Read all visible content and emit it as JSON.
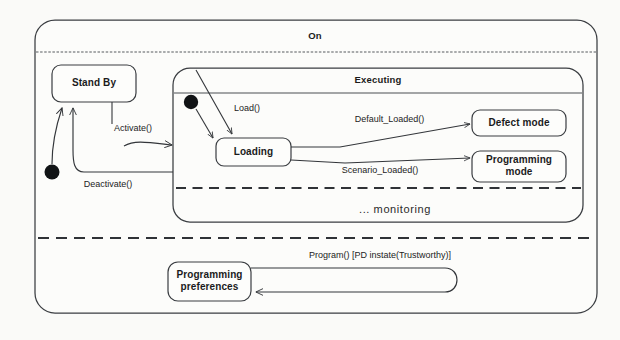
{
  "diagram": {
    "kind": "uml-state-machine-diagram",
    "background_color": "#fafaf8",
    "line_color": "#33363a",
    "text_color": "#1b1b1b"
  },
  "outer_state": {
    "name": "On",
    "label": "On"
  },
  "states": {
    "stand_by": {
      "label": "Stand By"
    },
    "executing": {
      "label": "Executing"
    },
    "loading": {
      "label": "Loading"
    },
    "defect_mode": {
      "label": "Defect mode"
    },
    "programming_mode_line1": {
      "label": "Programming"
    },
    "programming_mode_line2": {
      "label": "mode"
    },
    "programming_preferences_line1": {
      "label": "Programming"
    },
    "programming_preferences_line2": {
      "label": "preferences"
    }
  },
  "regions": {
    "monitoring": {
      "label": "... monitoring"
    }
  },
  "transitions": {
    "activate": {
      "label": "Activate()"
    },
    "deactivate": {
      "label": "Deactivate()"
    },
    "load": {
      "label": "Load()"
    },
    "default_loaded": {
      "label": "Default_Loaded()"
    },
    "scenario_loaded": {
      "label": "Scenario_Loaded()"
    },
    "program_guard": {
      "label": "Program() [PD instate(Trustworthy)]"
    }
  },
  "pseudostates": {
    "initial_on": {
      "name": "initial-state-on"
    },
    "initial_executing": {
      "name": "initial-state-executing"
    }
  }
}
